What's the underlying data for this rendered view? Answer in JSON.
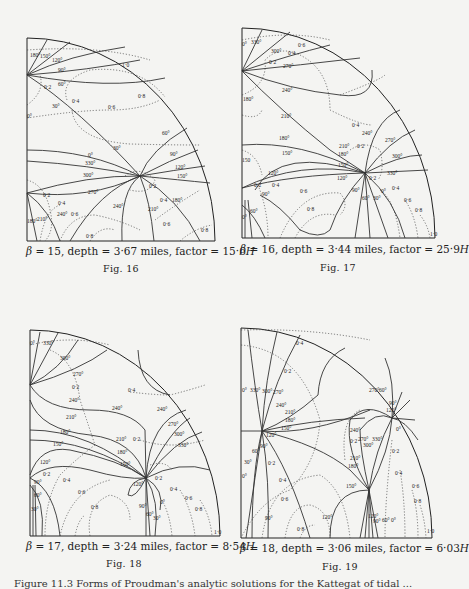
{
  "figures": [
    {
      "id": "fig16",
      "caption": {
        "beta_symbol": "β",
        "beta": "= 15, depth = 3·67 miles, factor = 15·6",
        "unit": "H"
      },
      "fig_label": "Fig. 16",
      "labels": [
        {
          "t": "180°",
          "x": 30,
          "y": 57
        },
        {
          "t": "150°",
          "x": 40,
          "y": 58
        },
        {
          "t": "120°",
          "x": 52,
          "y": 62
        },
        {
          "t": "90°",
          "x": 58,
          "y": 72
        },
        {
          "t": "60°",
          "x": 58,
          "y": 86
        },
        {
          "t": "0·2",
          "x": 44,
          "y": 89
        },
        {
          "t": "30°",
          "x": 52,
          "y": 108
        },
        {
          "t": "0·4",
          "x": 72,
          "y": 103
        },
        {
          "t": "0·6",
          "x": 108,
          "y": 109
        },
        {
          "t": "0·8",
          "x": 138,
          "y": 98
        },
        {
          "t": "1·0",
          "x": 122,
          "y": 67
        },
        {
          "t": "0°",
          "x": 27,
          "y": 118
        },
        {
          "t": "60°",
          "x": 162,
          "y": 135
        },
        {
          "t": "30°",
          "x": 113,
          "y": 150
        },
        {
          "t": "0°",
          "x": 88,
          "y": 157
        },
        {
          "t": "330°",
          "x": 85,
          "y": 165
        },
        {
          "t": "300°",
          "x": 83,
          "y": 177
        },
        {
          "t": "90°",
          "x": 170,
          "y": 156
        },
        {
          "t": "120°",
          "x": 175,
          "y": 169
        },
        {
          "t": "150°",
          "x": 177,
          "y": 178
        },
        {
          "t": "270°",
          "x": 88,
          "y": 194
        },
        {
          "t": "0·2",
          "x": 149,
          "y": 188
        },
        {
          "t": "0·2",
          "x": 43,
          "y": 197
        },
        {
          "t": "0·4",
          "x": 58,
          "y": 205
        },
        {
          "t": "0·4",
          "x": 160,
          "y": 202
        },
        {
          "t": "180°",
          "x": 172,
          "y": 202
        },
        {
          "t": "240°",
          "x": 113,
          "y": 208
        },
        {
          "t": "210°",
          "x": 148,
          "y": 211
        },
        {
          "t": "180°",
          "x": 27,
          "y": 223
        },
        {
          "t": "210°",
          "x": 37,
          "y": 221
        },
        {
          "t": "240°",
          "x": 57,
          "y": 216
        },
        {
          "t": "0·6",
          "x": 71,
          "y": 216
        },
        {
          "t": "0·6",
          "x": 163,
          "y": 226
        },
        {
          "t": "0·8",
          "x": 86,
          "y": 238
        },
        {
          "t": "0·8",
          "x": 201,
          "y": 232
        }
      ]
    },
    {
      "id": "fig17",
      "caption": {
        "beta_symbol": "β",
        "beta": "= 16, depth = 3·44 miles, factor = 25·9",
        "unit": "H"
      },
      "fig_label": "Fig. 17",
      "labels": [
        {
          "t": "0°",
          "x": 242,
          "y": 46
        },
        {
          "t": "330°",
          "x": 251,
          "y": 44
        },
        {
          "t": "300°",
          "x": 271,
          "y": 53
        },
        {
          "t": "0·4",
          "x": 288,
          "y": 55
        },
        {
          "t": "0·6",
          "x": 298,
          "y": 47
        },
        {
          "t": "0·2",
          "x": 269,
          "y": 64
        },
        {
          "t": "270°",
          "x": 283,
          "y": 68
        },
        {
          "t": "240°",
          "x": 282,
          "y": 92
        },
        {
          "t": "180°",
          "x": 243,
          "y": 101
        },
        {
          "t": "210°",
          "x": 281,
          "y": 118
        },
        {
          "t": "0·4",
          "x": 352,
          "y": 127
        },
        {
          "t": "240°",
          "x": 362,
          "y": 135
        },
        {
          "t": "270°",
          "x": 385,
          "y": 142
        },
        {
          "t": "180°",
          "x": 279,
          "y": 140
        },
        {
          "t": "210°",
          "x": 339,
          "y": 148
        },
        {
          "t": "0·2",
          "x": 357,
          "y": 148
        },
        {
          "t": "300°",
          "x": 392,
          "y": 158
        },
        {
          "t": "180°",
          "x": 338,
          "y": 156
        },
        {
          "t": "150°",
          "x": 282,
          "y": 155
        },
        {
          "t": "150",
          "x": 242,
          "y": 162
        },
        {
          "t": "150°",
          "x": 338,
          "y": 167
        },
        {
          "t": "330°",
          "x": 387,
          "y": 175
        },
        {
          "t": "120°",
          "x": 268,
          "y": 175
        },
        {
          "t": "120°",
          "x": 337,
          "y": 180
        },
        {
          "t": "0·2",
          "x": 369,
          "y": 180
        },
        {
          "t": "0·2",
          "x": 254,
          "y": 187
        },
        {
          "t": "0·4",
          "x": 272,
          "y": 187
        },
        {
          "t": "0°",
          "x": 381,
          "y": 193
        },
        {
          "t": "0·4",
          "x": 392,
          "y": 190
        },
        {
          "t": "90°",
          "x": 262,
          "y": 196
        },
        {
          "t": "0·6",
          "x": 300,
          "y": 193
        },
        {
          "t": "90°",
          "x": 352,
          "y": 192
        },
        {
          "t": "60°",
          "x": 362,
          "y": 200
        },
        {
          "t": "30°",
          "x": 373,
          "y": 200
        },
        {
          "t": "0·6",
          "x": 404,
          "y": 202
        },
        {
          "t": "60°",
          "x": 250,
          "y": 213
        },
        {
          "t": "0°",
          "x": 242,
          "y": 219
        },
        {
          "t": "0·8",
          "x": 307,
          "y": 211
        },
        {
          "t": "0·8",
          "x": 415,
          "y": 212
        },
        {
          "t": "1·0",
          "x": 430,
          "y": 236
        }
      ]
    },
    {
      "id": "fig18",
      "caption": {
        "beta_symbol": "β",
        "beta": "= 17, depth = 3·24 miles, factor = 8·54",
        "unit": "H"
      },
      "fig_label": "Fig. 18",
      "labels": [
        {
          "t": "0°",
          "x": 30,
          "y": 345
        },
        {
          "t": "330°",
          "x": 43,
          "y": 345
        },
        {
          "t": "300°",
          "x": 60,
          "y": 360
        },
        {
          "t": "270°",
          "x": 73,
          "y": 376
        },
        {
          "t": "0·2",
          "x": 72,
          "y": 389
        },
        {
          "t": "0·4",
          "x": 128,
          "y": 392
        },
        {
          "t": "240°",
          "x": 69,
          "y": 402
        },
        {
          "t": "240°",
          "x": 112,
          "y": 410
        },
        {
          "t": "240°",
          "x": 157,
          "y": 411
        },
        {
          "t": "270°",
          "x": 168,
          "y": 426
        },
        {
          "t": "210°",
          "x": 66,
          "y": 419
        },
        {
          "t": "300°",
          "x": 174,
          "y": 436
        },
        {
          "t": "180°",
          "x": 60,
          "y": 434
        },
        {
          "t": "210°",
          "x": 116,
          "y": 441
        },
        {
          "t": "0·2",
          "x": 133,
          "y": 441
        },
        {
          "t": "330°",
          "x": 178,
          "y": 447
        },
        {
          "t": "150°",
          "x": 53,
          "y": 446
        },
        {
          "t": "180°",
          "x": 117,
          "y": 454
        },
        {
          "t": "120°",
          "x": 40,
          "y": 464
        },
        {
          "t": "150°",
          "x": 120,
          "y": 466
        },
        {
          "t": "0·2",
          "x": 43,
          "y": 476
        },
        {
          "t": "0·4",
          "x": 63,
          "y": 482
        },
        {
          "t": "90°",
          "x": 34,
          "y": 484
        },
        {
          "t": "120°",
          "x": 133,
          "y": 486
        },
        {
          "t": "0·2",
          "x": 155,
          "y": 480
        },
        {
          "t": "0·4",
          "x": 170,
          "y": 491
        },
        {
          "t": "0·6",
          "x": 78,
          "y": 494
        },
        {
          "t": "60°",
          "x": 34,
          "y": 497
        },
        {
          "t": "0°",
          "x": 160,
          "y": 504
        },
        {
          "t": "0·6",
          "x": 185,
          "y": 500
        },
        {
          "t": "30°",
          "x": 31,
          "y": 511
        },
        {
          "t": "0·8",
          "x": 91,
          "y": 509
        },
        {
          "t": "90°",
          "x": 139,
          "y": 508
        },
        {
          "t": "60°",
          "x": 146,
          "y": 516
        },
        {
          "t": "30°",
          "x": 153,
          "y": 520
        },
        {
          "t": "0·8",
          "x": 195,
          "y": 511
        },
        {
          "t": "1·0",
          "x": 214,
          "y": 534
        }
      ]
    },
    {
      "id": "fig19",
      "caption": {
        "beta_symbol": "β",
        "beta": "= 18, depth = 3·06 miles, factor = 6·03",
        "unit": "H"
      },
      "fig_label": "Fig. 19",
      "labels": [
        {
          "t": "0·4",
          "x": 296,
          "y": 345
        },
        {
          "t": "0·2",
          "x": 284,
          "y": 373
        },
        {
          "t": "0°",
          "x": 242,
          "y": 392
        },
        {
          "t": "330°",
          "x": 250,
          "y": 392
        },
        {
          "t": "300°",
          "x": 262,
          "y": 393
        },
        {
          "t": "270°",
          "x": 273,
          "y": 394
        },
        {
          "t": "270°",
          "x": 369,
          "y": 392
        },
        {
          "t": "60°",
          "x": 379,
          "y": 392
        },
        {
          "t": "240°",
          "x": 276,
          "y": 407
        },
        {
          "t": "90°",
          "x": 389,
          "y": 405
        },
        {
          "t": "210°",
          "x": 285,
          "y": 414
        },
        {
          "t": "120°",
          "x": 386,
          "y": 412
        },
        {
          "t": "180°",
          "x": 285,
          "y": 422
        },
        {
          "t": "150°",
          "x": 281,
          "y": 430
        },
        {
          "t": "240°",
          "x": 350,
          "y": 432
        },
        {
          "t": "0°",
          "x": 396,
          "y": 431
        },
        {
          "t": "270°",
          "x": 358,
          "y": 441
        },
        {
          "t": "330°",
          "x": 372,
          "y": 441
        },
        {
          "t": "300°",
          "x": 363,
          "y": 447
        },
        {
          "t": "120°",
          "x": 266,
          "y": 437
        },
        {
          "t": "0·2",
          "x": 350,
          "y": 443
        },
        {
          "t": "90°",
          "x": 260,
          "y": 448
        },
        {
          "t": "0·2",
          "x": 392,
          "y": 453
        },
        {
          "t": "60°",
          "x": 252,
          "y": 453
        },
        {
          "t": "210°",
          "x": 350,
          "y": 460
        },
        {
          "t": "0·2",
          "x": 268,
          "y": 465
        },
        {
          "t": "180°",
          "x": 348,
          "y": 468
        },
        {
          "t": "30°",
          "x": 244,
          "y": 464
        },
        {
          "t": "0°",
          "x": 242,
          "y": 478
        },
        {
          "t": "0·4",
          "x": 395,
          "y": 475
        },
        {
          "t": "0·4",
          "x": 279,
          "y": 482
        },
        {
          "t": "150°",
          "x": 346,
          "y": 488
        },
        {
          "t": "0·6",
          "x": 412,
          "y": 488
        },
        {
          "t": "0·6",
          "x": 281,
          "y": 501
        },
        {
          "t": "0·8",
          "x": 414,
          "y": 503
        },
        {
          "t": "90°",
          "x": 265,
          "y": 520
        },
        {
          "t": "120°",
          "x": 322,
          "y": 519
        },
        {
          "t": "120°",
          "x": 368,
          "y": 518
        },
        {
          "t": "90°",
          "x": 373,
          "y": 523
        },
        {
          "t": "60°",
          "x": 382,
          "y": 522
        },
        {
          "t": "0°",
          "x": 391,
          "y": 522
        },
        {
          "t": "0·8",
          "x": 297,
          "y": 531
        },
        {
          "t": "1·0",
          "x": 427,
          "y": 533
        }
      ]
    }
  ],
  "bottom_caption": "Figure 11.3  Forms of Proudman's analytic solutions for the Kattegat of tidal ..."
}
